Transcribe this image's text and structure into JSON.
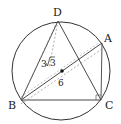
{
  "figure": {
    "type": "geometry-diagram",
    "points": {
      "A": {
        "label": "A",
        "x": 102,
        "y": 43
      },
      "B": {
        "label": "B",
        "x": 21,
        "y": 100
      },
      "C": {
        "label": "C",
        "x": 101,
        "y": 100
      },
      "D": {
        "label": "D",
        "x": 58,
        "y": 21
      },
      "O": {
        "label": "",
        "x": 62,
        "y": 71
      }
    },
    "circle": {
      "cx": 61,
      "cy": 71,
      "r": 49
    },
    "measurements": {
      "dashed_length_label": "3√3",
      "diameter_label": "6"
    },
    "labels": {
      "A": "A",
      "B": "B",
      "C": "C",
      "D": "D",
      "len1_main": "3",
      "len1_root": "3",
      "len2": "6"
    },
    "colors": {
      "stroke": "#333333",
      "dashed": "#888888",
      "background": "#ffffff"
    }
  }
}
